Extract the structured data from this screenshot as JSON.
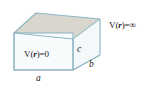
{
  "figure": {
    "name": "infinite-rectangular-potential-well-box",
    "shape": "rectangular-box-oblique-projection",
    "labels": {
      "potential_inside": {
        "prefix": "V(",
        "variable": "r",
        "suffix": ")=0",
        "full_text": "V(r)=0"
      },
      "potential_outside": {
        "prefix": "V(",
        "variable": "r",
        "suffix": ")=∞",
        "full_text": "V(r)=∞"
      },
      "dimension_a": "a",
      "dimension_b": "b",
      "dimension_c": "c"
    },
    "colors": {
      "top_face": "#d9d6cd",
      "front_face": "#f7fbfc",
      "right_face": "#f2f7f9",
      "edge_stroke": "#8fb6c4",
      "edge_stroke_light": "#b9d2dc",
      "text": "#1a1a1a",
      "background": "#ffffff"
    },
    "geometry": {
      "front_face": {
        "x1": 14,
        "y1": 33,
        "x2": 73,
        "y2": 70
      },
      "top_back_left": {
        "x": 36,
        "y": 13
      },
      "top_back_right": {
        "x": 100,
        "y": 19
      },
      "right_bottom_back": {
        "x": 100,
        "y": 55
      }
    }
  }
}
